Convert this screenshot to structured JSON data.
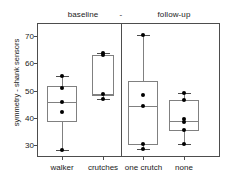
{
  "chart_data": {
    "type": "box",
    "title": "",
    "ylabel": "symmetry - shank sensors",
    "xlabel": "",
    "ylim": [
      25,
      73
    ],
    "yticks": [
      30,
      40,
      50,
      60,
      70
    ],
    "ytick_labels": [
      "30",
      "40",
      "50",
      "60",
      "70"
    ],
    "grid": false,
    "legend": "none",
    "panels": [
      {
        "label": "baseline"
      },
      {
        "label": "-"
      },
      {
        "label": "follow-up"
      }
    ],
    "categories": [
      "walker",
      "crutches",
      "one crutch",
      "none"
    ],
    "boxes": [
      {
        "category": "walker",
        "whisker_low": 28.3,
        "q1": 38.3,
        "median": 45.7,
        "q3": 51.8,
        "whisker_high": 55.2,
        "points": [
          55.2,
          51.0,
          45.7,
          42.0,
          28.3
        ]
      },
      {
        "category": "crutches",
        "whisker_low": 46.8,
        "q1": 47.8,
        "median": 48.8,
        "q3": 63.2,
        "whisker_high": 63.8,
        "points": [
          63.8,
          63.2,
          48.8,
          47.0
        ]
      },
      {
        "category": "one crutch",
        "whisker_low": 28.5,
        "q1": 30.0,
        "median": 44.3,
        "q3": 53.5,
        "whisker_high": 70.2,
        "points": [
          70.2,
          48.5,
          44.3,
          30.3,
          28.5
        ]
      },
      {
        "category": "none",
        "whisker_low": 30.2,
        "q1": 35.3,
        "median": 38.8,
        "q3": 46.5,
        "whisker_high": 49.2,
        "points": [
          49.2,
          46.5,
          39.5,
          38.5,
          35.5,
          30.2
        ]
      }
    ],
    "colors": {
      "box_stroke": "#808080",
      "whisker": "#808080",
      "point": "#000000",
      "axis": "#4d4d4d",
      "background": "#ffffff"
    }
  },
  "headers": {
    "baseline": "baseline",
    "separator": "-",
    "followup": "follow-up"
  },
  "axis": {
    "ylabel": "symmetry - shank sensors",
    "ytick_0": "30",
    "ytick_1": "40",
    "ytick_2": "50",
    "ytick_3": "60",
    "ytick_4": "70",
    "xtick_0": "walker",
    "xtick_1": "crutches",
    "xtick_2": "one crutch",
    "xtick_3": "none"
  }
}
